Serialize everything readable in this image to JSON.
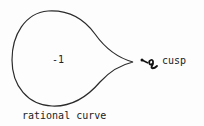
{
  "diagram": {
    "curve_label": "-1",
    "cusp_label": "cusp",
    "caption": "rational curve",
    "stroke_color": "#2a2a2a"
  }
}
